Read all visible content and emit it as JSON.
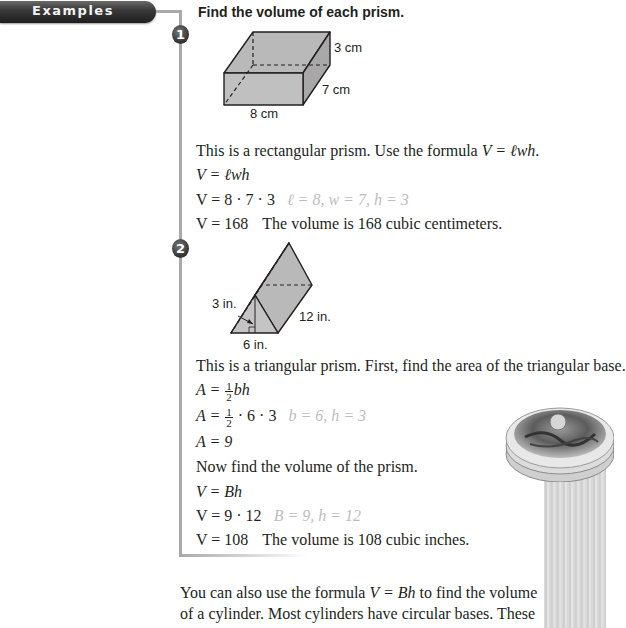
{
  "header": {
    "label": "Examples"
  },
  "instructions": "Find the volume of each prism.",
  "example1": {
    "number": "1",
    "figure": {
      "shape": "rectangular-prism",
      "labels": {
        "height": "3 cm",
        "width": "7 cm",
        "length": "8 cm"
      }
    },
    "intro": {
      "before": "This is a rectangular prism. Use the formula ",
      "formula": "V = ℓwh",
      "after": "."
    },
    "steps": [
      {
        "expr": "V = ℓwh",
        "note": ""
      },
      {
        "expr": "V = 8 · 7 · 3",
        "note": "ℓ = 8, w = 7, h = 3"
      },
      {
        "expr": "V = 168",
        "note": "The volume is 168 cubic centimeters."
      }
    ]
  },
  "example2": {
    "number": "2",
    "figure": {
      "shape": "triangular-prism",
      "labels": {
        "height": "3 in.",
        "length": "12 in.",
        "base": "6 in."
      }
    },
    "intro": "This is a triangular prism. First, find the area of the triangular base.",
    "area_steps": [
      {
        "lhs": "A = ",
        "frac_num": "1",
        "frac_den": "2",
        "rest": "bh",
        "note": ""
      },
      {
        "lhs": "A = ",
        "frac_num": "1",
        "frac_den": "2",
        "rest": " · 6 · 3",
        "note": "b = 6, h = 3"
      },
      {
        "lhs": "A = 9",
        "note": ""
      }
    ],
    "volume_intro": "Now find the volume of the prism.",
    "volume_steps": [
      {
        "expr": "V = Bh",
        "note": ""
      },
      {
        "expr": "V = 9 · 12",
        "note": "B = 9, h = 12"
      },
      {
        "expr": "V = 108",
        "note": "The volume is 108 cubic inches."
      }
    ]
  },
  "closing": {
    "line1_before": "You can also use the formula ",
    "line1_formula": "V = Bh",
    "line1_after": " to find the volume",
    "line2": "of a cylinder. Most cylinders have circular bases. These"
  },
  "colors": {
    "connector": "#a9a9a9",
    "note": "#bdbdbd",
    "shape_fill": "#bfbfbf",
    "pill": "#2a2a2a"
  }
}
